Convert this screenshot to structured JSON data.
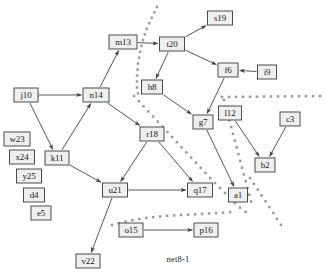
{
  "diagram": {
    "caption": "net8-1",
    "caption_pos": {
      "x": 178,
      "y": 262
    },
    "colors": {
      "node_fill": "#efefef",
      "node_stroke": "#3a3a3a",
      "edge": "#3a3a3a",
      "cut_line": "#9a9a9a",
      "background": "#ffffff",
      "text": "#1a1a1a"
    },
    "nodes": [
      {
        "id": "j10",
        "label": "j10",
        "x": 26,
        "y": 95,
        "w": 24,
        "h": 14
      },
      {
        "id": "n14",
        "label": "n14",
        "x": 96,
        "y": 95,
        "w": 26,
        "h": 14
      },
      {
        "id": "m13",
        "label": "m13",
        "x": 123,
        "y": 42,
        "w": 28,
        "h": 14
      },
      {
        "id": "t20",
        "label": "t20",
        "x": 172,
        "y": 44,
        "w": 25,
        "h": 14
      },
      {
        "id": "s19",
        "label": "s19",
        "x": 220,
        "y": 18,
        "w": 25,
        "h": 14
      },
      {
        "id": "f6",
        "label": "f6",
        "x": 228,
        "y": 70,
        "w": 20,
        "h": 14
      },
      {
        "id": "i9",
        "label": "i9",
        "x": 267,
        "y": 72,
        "w": 19,
        "h": 14
      },
      {
        "id": "h8",
        "label": "h8",
        "x": 152,
        "y": 87,
        "w": 21,
        "h": 14
      },
      {
        "id": "g7",
        "label": "g7",
        "x": 203,
        "y": 122,
        "w": 20,
        "h": 14
      },
      {
        "id": "l12",
        "label": "l12",
        "x": 230,
        "y": 113,
        "w": 23,
        "h": 14
      },
      {
        "id": "c3",
        "label": "c3",
        "x": 290,
        "y": 119,
        "w": 20,
        "h": 14
      },
      {
        "id": "b2",
        "label": "b2",
        "x": 265,
        "y": 165,
        "w": 20,
        "h": 14
      },
      {
        "id": "a1",
        "label": "a1",
        "x": 238,
        "y": 195,
        "w": 19,
        "h": 14
      },
      {
        "id": "r18",
        "label": "r18",
        "x": 152,
        "y": 134,
        "w": 24,
        "h": 14
      },
      {
        "id": "k11",
        "label": "k11",
        "x": 57,
        "y": 158,
        "w": 24,
        "h": 14
      },
      {
        "id": "u21",
        "label": "u21",
        "x": 115,
        "y": 190,
        "w": 25,
        "h": 14
      },
      {
        "id": "q17",
        "label": "q17",
        "x": 200,
        "y": 190,
        "w": 25,
        "h": 14
      },
      {
        "id": "o15",
        "label": "o15",
        "x": 131,
        "y": 230,
        "w": 24,
        "h": 14
      },
      {
        "id": "p16",
        "label": "p16",
        "x": 206,
        "y": 230,
        "w": 24,
        "h": 14
      },
      {
        "id": "v22",
        "label": "v22",
        "x": 88,
        "y": 261,
        "w": 24,
        "h": 14
      },
      {
        "id": "w23",
        "label": "w23",
        "x": 17,
        "y": 139,
        "w": 26,
        "h": 14
      },
      {
        "id": "x24",
        "label": "x24",
        "x": 22,
        "y": 157,
        "w": 25,
        "h": 14
      },
      {
        "id": "y25",
        "label": "y25",
        "x": 29,
        "y": 176,
        "w": 25,
        "h": 14
      },
      {
        "id": "d4",
        "label": "d4",
        "x": 34,
        "y": 195,
        "w": 21,
        "h": 14
      },
      {
        "id": "e5",
        "label": "e5",
        "x": 41,
        "y": 213,
        "w": 20,
        "h": 14
      }
    ],
    "edges": [
      {
        "from": "j10",
        "to": "n14",
        "arrow": "both"
      },
      {
        "from": "j10",
        "to": "k11",
        "arrow": "to"
      },
      {
        "from": "k11",
        "to": "n14",
        "arrow": "to"
      },
      {
        "from": "n14",
        "to": "m13",
        "arrow": "to"
      },
      {
        "from": "m13",
        "to": "t20",
        "arrow": "to"
      },
      {
        "from": "n14",
        "to": "r18",
        "arrow": "to"
      },
      {
        "from": "t20",
        "to": "s19",
        "arrow": "to"
      },
      {
        "from": "t20",
        "to": "f6",
        "arrow": "to"
      },
      {
        "from": "t20",
        "to": "h8",
        "arrow": "to"
      },
      {
        "from": "h8",
        "to": "g7",
        "arrow": "to"
      },
      {
        "from": "i9",
        "to": "f6",
        "arrow": "to"
      },
      {
        "from": "f6",
        "to": "g7",
        "arrow": "to"
      },
      {
        "from": "g7",
        "to": "a1",
        "arrow": "to"
      },
      {
        "from": "l12",
        "to": "b2",
        "arrow": "to"
      },
      {
        "from": "c3",
        "to": "b2",
        "arrow": "to"
      },
      {
        "from": "r18",
        "to": "u21",
        "arrow": "to"
      },
      {
        "from": "r18",
        "to": "q17",
        "arrow": "to"
      },
      {
        "from": "k11",
        "to": "u21",
        "arrow": "to"
      },
      {
        "from": "u21",
        "to": "q17",
        "arrow": "both"
      },
      {
        "from": "u21",
        "to": "v22",
        "arrow": "to"
      },
      {
        "from": "o15",
        "to": "p16",
        "arrow": "to"
      }
    ],
    "cut_lines": [
      {
        "id": "cut-top",
        "points": [
          [
            157,
            7
          ],
          [
            152,
            17
          ],
          [
            147,
            28
          ],
          [
            143,
            40
          ],
          [
            140,
            52
          ],
          [
            138,
            64
          ],
          [
            137,
            76
          ],
          [
            137,
            88
          ],
          [
            139,
            99
          ]
        ],
        "spacing": 6
      },
      {
        "id": "cut-main-diagonal",
        "points": [
          [
            134,
            96
          ],
          [
            147,
            110
          ],
          [
            160,
            124
          ],
          [
            173,
            138
          ],
          [
            186,
            152
          ],
          [
            199,
            166
          ],
          [
            212,
            180
          ],
          [
            225,
            193
          ],
          [
            238,
            206
          ],
          [
            251,
            216
          ]
        ],
        "spacing": 7
      },
      {
        "id": "cut-horizontal",
        "points": [
          [
            222,
            97
          ],
          [
            320,
            96
          ]
        ],
        "spacing": 7
      },
      {
        "id": "cut-right-upper",
        "points": [
          [
            224,
            100
          ],
          [
            228,
            115
          ],
          [
            232,
            130
          ],
          [
            236,
            145
          ],
          [
            240,
            160
          ],
          [
            244,
            175
          ],
          [
            248,
            190
          ],
          [
            252,
            205
          ]
        ],
        "spacing": 7
      },
      {
        "id": "cut-right-lower",
        "points": [
          [
            250,
            178
          ],
          [
            258,
            190
          ],
          [
            266,
            202
          ],
          [
            274,
            214
          ],
          [
            281,
            225
          ]
        ],
        "spacing": 7
      },
      {
        "id": "cut-bottom",
        "points": [
          [
            112,
            225
          ],
          [
            128,
            221
          ],
          [
            146,
            218
          ],
          [
            164,
            216
          ],
          [
            182,
            215
          ],
          [
            200,
            214
          ],
          [
            218,
            213
          ],
          [
            232,
            212
          ]
        ],
        "spacing": 7
      }
    ]
  }
}
